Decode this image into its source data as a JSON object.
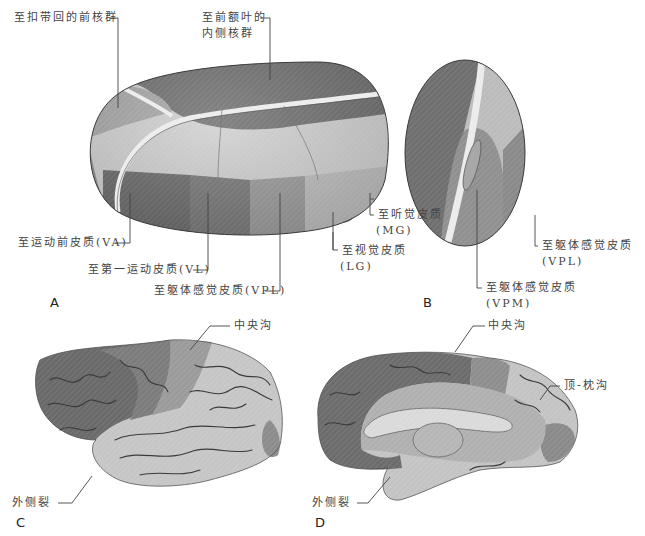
{
  "figure": {
    "panels": {
      "A": "A",
      "B": "B",
      "C": "C",
      "D": "D"
    },
    "panel_A": {
      "labels": {
        "cingulate_anterior": "至扣带回的前核群",
        "frontal_medial_line1": "至前额叶的",
        "frontal_medial_line2": "内侧核群",
        "premotor_VA": "至运动前皮质(VA)",
        "primary_motor_VL": "至第一运动皮质(VL)",
        "somatosensory_VPL": "至躯体感觉皮质(VPL)",
        "visual_line1": "至视觉皮质",
        "visual_line2": "(LG)",
        "auditory_line1": "至听觉皮质",
        "auditory_line2": "(MG)"
      }
    },
    "panel_B": {
      "labels": {
        "vpl_line1": "至躯体感觉皮质",
        "vpl_line2": "(VPL)",
        "vpm_line1": "至躯体感觉皮质",
        "vpm_line2": "(VPM)"
      }
    },
    "panel_C": {
      "labels": {
        "central_sulcus": "中央沟",
        "lateral_fissure": "外侧裂"
      }
    },
    "panel_D": {
      "labels": {
        "central_sulcus": "中央沟",
        "parieto_occipital_sulcus": "顶-枕沟",
        "lateral_fissure": "外侧裂"
      }
    },
    "colors": {
      "dark": "#6a6a6a",
      "mid_dark": "#858585",
      "mid": "#9c9c9c",
      "light": "#c9c9c9",
      "lighter": "#dedede",
      "outline": "#3c3c3c",
      "leader": "#444444"
    }
  }
}
